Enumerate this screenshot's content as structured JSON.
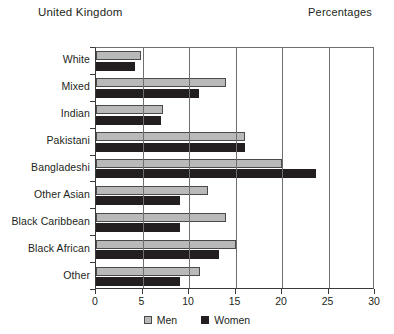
{
  "header": {
    "title_left": "United Kingdom",
    "title_right": "Percentages"
  },
  "legend": {
    "men_label": "Men",
    "women_label": "Women"
  },
  "colors": {
    "men": "#b9b9b9",
    "women": "#231f20",
    "axis": "#3a3a3a",
    "grid": "#6f6f6f"
  },
  "chart_data": {
    "type": "bar",
    "orientation": "horizontal",
    "title": "United Kingdom",
    "subtitle": "Percentages",
    "xlabel": "",
    "ylabel": "",
    "xlim": [
      0,
      30
    ],
    "xticks": [
      0,
      5,
      10,
      15,
      20,
      25,
      30
    ],
    "xtick_labels": [
      "0",
      "5",
      "10",
      "15",
      "20",
      "25",
      "30"
    ],
    "grid": true,
    "legend_position": "bottom-center",
    "categories": [
      "White",
      "Mixed",
      "Indian",
      "Pakistani",
      "Bangladeshi",
      "Other Asian",
      "Black Caribbean",
      "Black African",
      "Other"
    ],
    "series": [
      {
        "name": "Men",
        "color": "#b9b9b9",
        "values": [
          4.8,
          14.0,
          7.2,
          16.0,
          20.0,
          12.0,
          14.0,
          15.0,
          11.2
        ]
      },
      {
        "name": "Women",
        "color": "#231f20",
        "values": [
          4.2,
          11.1,
          7.0,
          16.0,
          23.7,
          9.0,
          9.0,
          13.2,
          9.0
        ]
      }
    ]
  }
}
